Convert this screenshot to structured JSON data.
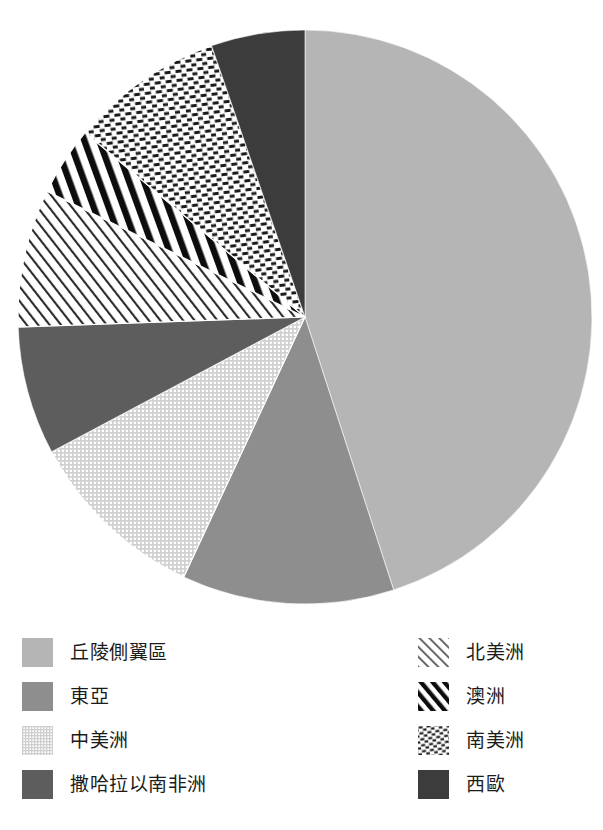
{
  "chart_data": {
    "type": "pie",
    "title": "",
    "subtitle": "",
    "legend_position": "bottom",
    "start_angle_deg": 0,
    "direction": "clockwise",
    "total": 100,
    "categories": [
      "丘陵側翼區",
      "東亞",
      "中美洲",
      "撒哈拉以南非洲",
      "北美洲",
      "澳洲",
      "南美洲",
      "西歐"
    ],
    "values": [
      45.0,
      12.0,
      10.3,
      7.2,
      7.8,
      3.9,
      8.6,
      5.2
    ],
    "slices": [
      {
        "label": "丘陵側翼區",
        "value": 45.0,
        "start_deg": 0,
        "end_deg": 162,
        "pattern": "solid",
        "color": "#b5b5b5",
        "legend_column": "left",
        "legend_index": 0
      },
      {
        "label": "東亞",
        "value": 12.0,
        "start_deg": 162,
        "end_deg": 205,
        "pattern": "solid",
        "color": "#8e8e8e",
        "legend_column": "left",
        "legend_index": 1
      },
      {
        "label": "中美洲",
        "value": 10.3,
        "start_deg": 205,
        "end_deg": 242,
        "pattern": "fine-grid",
        "color": "#e6e6e6",
        "legend_column": "left",
        "legend_index": 2
      },
      {
        "label": "撒哈拉以南非洲",
        "value": 7.2,
        "start_deg": 242,
        "end_deg": 268,
        "pattern": "solid",
        "color": "#5d5d5d",
        "legend_column": "left",
        "legend_index": 3
      },
      {
        "label": "北美洲",
        "value": 7.8,
        "start_deg": 268,
        "end_deg": 296,
        "pattern": "thin-diagonal",
        "color": "#3a3a3a",
        "legend_column": "right",
        "legend_index": 0
      },
      {
        "label": "澳洲",
        "value": 3.9,
        "start_deg": 296,
        "end_deg": 310,
        "pattern": "thick-diagonal",
        "color": "#111111",
        "legend_column": "right",
        "legend_index": 1
      },
      {
        "label": "南美洲",
        "value": 8.6,
        "start_deg": 310,
        "end_deg": 341,
        "pattern": "checker-dash",
        "color": "#222222",
        "legend_column": "right",
        "legend_index": 2
      },
      {
        "label": "西歐",
        "value": 5.2,
        "start_deg": 341,
        "end_deg": 360,
        "pattern": "solid",
        "color": "#3c3c3c",
        "legend_column": "right",
        "legend_index": 3
      }
    ],
    "geometry": {
      "center_x": 305,
      "center_y": 317,
      "radius": 287
    }
  },
  "legend": {
    "left_items": [
      {
        "label": "丘陵側翼區",
        "pattern": "solid",
        "color": "#b5b5b5"
      },
      {
        "label": "東亞",
        "pattern": "solid",
        "color": "#8e8e8e"
      },
      {
        "label": "中美洲",
        "pattern": "fine-grid",
        "color": "#e6e6e6"
      },
      {
        "label": "撒哈拉以南非洲",
        "pattern": "solid",
        "color": "#5d5d5d"
      }
    ],
    "right_items": [
      {
        "label": "北美洲",
        "pattern": "thin-diagonal",
        "color": "#3a3a3a"
      },
      {
        "label": "澳洲",
        "pattern": "thick-diagonal",
        "color": "#111111"
      },
      {
        "label": "南美洲",
        "pattern": "checker-dash",
        "color": "#222222"
      },
      {
        "label": "西歐",
        "pattern": "solid",
        "color": "#3c3c3c"
      }
    ]
  }
}
